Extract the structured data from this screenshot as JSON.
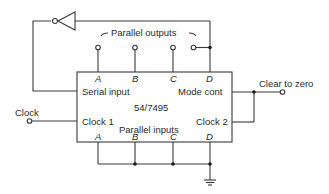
{
  "diagram": {
    "chip": "54/7495",
    "labels": {
      "parallel_outputs": "Parallel outputs",
      "parallel_inputs": "Parallel inputs",
      "serial_input": "Serial input",
      "mode_cont": "Mode  cont",
      "clock1": "Clock 1",
      "clock2": "Clock 2",
      "clock": "Clock",
      "clear_to_zero": "Clear to zero"
    },
    "top_pins": [
      "A",
      "B",
      "C",
      "D"
    ],
    "bottom_pins": [
      "A",
      "B",
      "C",
      "D"
    ],
    "colors": {
      "line": "#3a3a3a",
      "text": "#2a2a2a"
    }
  }
}
